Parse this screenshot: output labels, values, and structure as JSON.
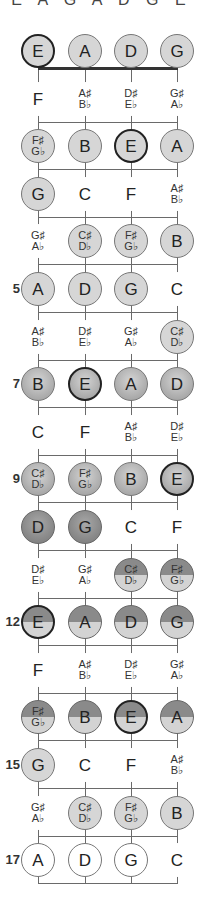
{
  "header": {
    "text": "E A G A D G E"
  },
  "strings": [
    "E",
    "A",
    "D",
    "G"
  ],
  "fret_numbers": [
    {
      "fret": 5,
      "label": "5"
    },
    {
      "fret": 7,
      "label": "7"
    },
    {
      "fret": 9,
      "label": "9"
    },
    {
      "fret": 12,
      "label": "12"
    },
    {
      "fret": 15,
      "label": "15"
    },
    {
      "fret": 17,
      "label": "17"
    }
  ],
  "frets": [
    {
      "fret": 0,
      "notes": [
        {
          "top": "E",
          "style": "light root"
        },
        {
          "top": "A",
          "style": "light"
        },
        {
          "top": "D",
          "style": "light"
        },
        {
          "top": "G",
          "style": "light"
        }
      ]
    },
    {
      "fret": 1,
      "notes": [
        {
          "top": "F",
          "style": "none"
        },
        {
          "top": "A♯",
          "bottom": "B♭",
          "style": "none"
        },
        {
          "top": "D♯",
          "bottom": "E♭",
          "style": "none"
        },
        {
          "top": "G♯",
          "bottom": "A♭",
          "style": "none"
        }
      ]
    },
    {
      "fret": 2,
      "notes": [
        {
          "top": "F♯",
          "bottom": "G♭",
          "style": "light"
        },
        {
          "top": "B",
          "style": "light"
        },
        {
          "top": "E",
          "style": "light root"
        },
        {
          "top": "A",
          "style": "light"
        }
      ]
    },
    {
      "fret": 3,
      "notes": [
        {
          "top": "G",
          "style": "light"
        },
        {
          "top": "C",
          "style": "none"
        },
        {
          "top": "F",
          "style": "none"
        },
        {
          "top": "A♯",
          "bottom": "B♭",
          "style": "none"
        }
      ]
    },
    {
      "fret": 4,
      "notes": [
        {
          "top": "G♯",
          "bottom": "A♭",
          "style": "none"
        },
        {
          "top": "C♯",
          "bottom": "D♭",
          "style": "light"
        },
        {
          "top": "F♯",
          "bottom": "G♭",
          "style": "light"
        },
        {
          "top": "B",
          "style": "light"
        }
      ]
    },
    {
      "fret": 5,
      "notes": [
        {
          "top": "A",
          "style": "light"
        },
        {
          "top": "D",
          "style": "light"
        },
        {
          "top": "G",
          "style": "light"
        },
        {
          "top": "C",
          "style": "none"
        }
      ]
    },
    {
      "fret": 6,
      "notes": [
        {
          "top": "A♯",
          "bottom": "B♭",
          "style": "none"
        },
        {
          "top": "D♯",
          "bottom": "E♭",
          "style": "none"
        },
        {
          "top": "G♯",
          "bottom": "A♭",
          "style": "none"
        },
        {
          "top": "C♯",
          "bottom": "D♭",
          "style": "light"
        }
      ]
    },
    {
      "fret": 7,
      "notes": [
        {
          "top": "B",
          "style": "mid"
        },
        {
          "top": "E",
          "style": "mid root"
        },
        {
          "top": "A",
          "style": "mid"
        },
        {
          "top": "D",
          "style": "mid"
        }
      ]
    },
    {
      "fret": 8,
      "notes": [
        {
          "top": "C",
          "style": "none"
        },
        {
          "top": "F",
          "style": "none"
        },
        {
          "top": "A♯",
          "bottom": "B♭",
          "style": "none"
        },
        {
          "top": "D♯",
          "bottom": "E♭",
          "style": "none"
        }
      ]
    },
    {
      "fret": 9,
      "notes": [
        {
          "top": "C♯",
          "bottom": "D♭",
          "style": "mid"
        },
        {
          "top": "F♯",
          "bottom": "G♭",
          "style": "mid"
        },
        {
          "top": "B",
          "style": "mid"
        },
        {
          "top": "E",
          "style": "mid root"
        }
      ]
    },
    {
      "fret": 10,
      "notes": [
        {
          "top": "D",
          "style": "dark"
        },
        {
          "top": "G",
          "style": "dark"
        },
        {
          "top": "C",
          "style": "none"
        },
        {
          "top": "F",
          "style": "none"
        }
      ]
    },
    {
      "fret": 11,
      "notes": [
        {
          "top": "D♯",
          "bottom": "E♭",
          "style": "none"
        },
        {
          "top": "G♯",
          "bottom": "A♭",
          "style": "none"
        },
        {
          "top": "C♯",
          "bottom": "D♭",
          "style": "split"
        },
        {
          "top": "F♯",
          "bottom": "G♭",
          "style": "split"
        }
      ]
    },
    {
      "fret": 12,
      "notes": [
        {
          "top": "E",
          "style": "split root"
        },
        {
          "top": "A",
          "style": "split"
        },
        {
          "top": "D",
          "style": "split"
        },
        {
          "top": "G",
          "style": "split"
        }
      ]
    },
    {
      "fret": 13,
      "notes": [
        {
          "top": "F",
          "style": "none"
        },
        {
          "top": "A♯",
          "bottom": "B♭",
          "style": "none"
        },
        {
          "top": "D♯",
          "bottom": "E♭",
          "style": "none"
        },
        {
          "top": "G♯",
          "bottom": "A♭",
          "style": "none"
        }
      ]
    },
    {
      "fret": 14,
      "notes": [
        {
          "top": "F♯",
          "bottom": "G♭",
          "style": "split"
        },
        {
          "top": "B",
          "style": "split"
        },
        {
          "top": "E",
          "style": "split root"
        },
        {
          "top": "A",
          "style": "split"
        }
      ]
    },
    {
      "fret": 15,
      "notes": [
        {
          "top": "G",
          "style": "light"
        },
        {
          "top": "C",
          "style": "none"
        },
        {
          "top": "F",
          "style": "none"
        },
        {
          "top": "A♯",
          "bottom": "B♭",
          "style": "none"
        }
      ]
    },
    {
      "fret": 16,
      "notes": [
        {
          "top": "G♯",
          "bottom": "A♭",
          "style": "none"
        },
        {
          "top": "C♯",
          "bottom": "D♭",
          "style": "light"
        },
        {
          "top": "F♯",
          "bottom": "G♭",
          "style": "light"
        },
        {
          "top": "B",
          "style": "light"
        }
      ]
    },
    {
      "fret": 17,
      "notes": [
        {
          "top": "A",
          "style": "white"
        },
        {
          "top": "D",
          "style": "white"
        },
        {
          "top": "G",
          "style": "white"
        },
        {
          "top": "C",
          "style": "none"
        }
      ]
    }
  ],
  "colors": {
    "light": "#d6d6d6",
    "mid": "#b0b0b0",
    "dark": "#8a8a8a",
    "line": "#6a6a6a",
    "nut": "#333333"
  }
}
